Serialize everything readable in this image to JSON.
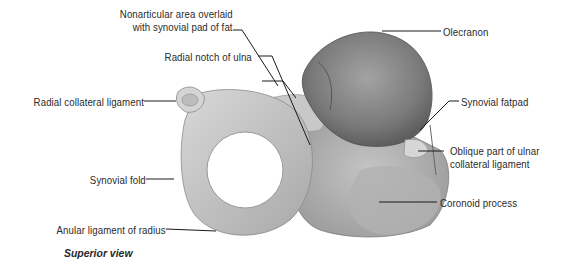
{
  "figure": {
    "caption": "Superior view",
    "labels": {
      "nonarticular_line1": "Nonarticular area overlaid",
      "nonarticular_line2": "with synovial pad of fat",
      "radial_notch": "Radial notch of ulna",
      "radial_collateral": "Radial collateral ligament",
      "synovial_fold": "Synovial fold",
      "anular_ligament": "Anular ligament of radius",
      "olecranon": "Olecranon",
      "synovial_fatpad": "Synovial fatpad",
      "oblique_line1": "Oblique part of ulnar",
      "oblique_line2": "collateral ligament",
      "coronoid": "Coronoid process"
    }
  }
}
